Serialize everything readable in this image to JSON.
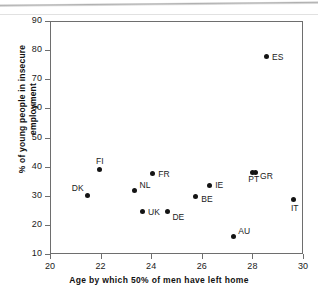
{
  "chart_data": {
    "type": "scatter",
    "title": "",
    "xlabel": "Age by which 50% of men have left home",
    "ylabel_line1": "% of young people in insecure",
    "ylabel_line2": "employment",
    "xlim": [
      20,
      30
    ],
    "ylim": [
      10,
      90
    ],
    "xticks": [
      20,
      22,
      24,
      26,
      28,
      30
    ],
    "yticks": [
      10,
      20,
      30,
      40,
      50,
      60,
      70,
      80,
      90
    ],
    "grid": false,
    "legend": "none",
    "marker": "filled-diamond",
    "marker_color": "#141414",
    "frame_color": "#6e6e6e",
    "points": [
      {
        "label": "DK",
        "x": 21.45,
        "y": 30.4,
        "label_dx": -16,
        "label_dy": -13
      },
      {
        "label": "FI",
        "x": 21.9,
        "y": 39.2,
        "label_dx": -3,
        "label_dy": -14
      },
      {
        "label": "NL",
        "x": 23.3,
        "y": 32.0,
        "label_dx": 5,
        "label_dy": -11
      },
      {
        "label": "UK",
        "x": 23.6,
        "y": 25.0,
        "label_dx": 6,
        "label_dy": -4
      },
      {
        "label": "DE",
        "x": 24.6,
        "y": 25.0,
        "label_dx": 5,
        "label_dy": 1
      },
      {
        "label": "FR",
        "x": 24.0,
        "y": 37.9,
        "label_dx": 6,
        "label_dy": -5
      },
      {
        "label": "BE",
        "x": 25.7,
        "y": 30.2,
        "label_dx": 6,
        "label_dy": -2
      },
      {
        "label": "IE",
        "x": 26.25,
        "y": 34.0,
        "label_dx": 6,
        "label_dy": -5
      },
      {
        "label": "AU",
        "x": 27.2,
        "y": 16.4,
        "label_dx": 5,
        "label_dy": -10
      },
      {
        "label": "PT",
        "x": 27.95,
        "y": 38.4,
        "label_dx": -4,
        "label_dy": 2
      },
      {
        "label": "GR",
        "x": 28.1,
        "y": 38.4,
        "label_dx": 4,
        "label_dy": -1
      },
      {
        "label": "ES",
        "x": 28.5,
        "y": 78.1,
        "label_dx": 6,
        "label_dy": -5
      },
      {
        "label": "IT",
        "x": 29.6,
        "y": 28.9,
        "label_dx": -3,
        "label_dy": 3
      }
    ]
  }
}
